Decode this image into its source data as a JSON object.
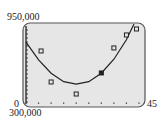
{
  "chart_data": {
    "type": "scatter",
    "title": "",
    "xlabel": "",
    "ylabel": "",
    "xlim": [
      0,
      45
    ],
    "ylim": [
      300000,
      950000
    ],
    "x_tick_step": 5,
    "grid": false,
    "labels": {
      "ymax": "950,000",
      "ymin": "300,000",
      "xmin": "0",
      "xmax": "45"
    },
    "series": [
      {
        "name": "data points",
        "type": "scatter",
        "marker": "square",
        "x": [
          6,
          10,
          20,
          30,
          35,
          40,
          44
        ],
        "y": [
          728000,
          473000,
          374000,
          547000,
          753000,
          860000,
          909000
        ]
      },
      {
        "name": "quadratic model",
        "type": "line",
        "x": [
          0,
          5,
          10,
          15,
          20,
          25,
          30,
          35,
          40,
          43
        ],
        "y": [
          800000,
          655000,
          545000,
          475000,
          455000,
          475000,
          545000,
          660000,
          820000,
          950000
        ]
      }
    ],
    "colors": {
      "screen_bg": "#e6e6e6",
      "frame": "#555555",
      "ink": "#222222"
    }
  }
}
